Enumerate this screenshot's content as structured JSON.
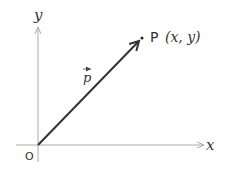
{
  "diagram": {
    "type": "vector-coordinate-plane",
    "axes": {
      "x_label": "x",
      "y_label": "y",
      "origin_label": "O"
    },
    "vector": {
      "label": "p",
      "from": "O",
      "to": "P"
    },
    "point": {
      "name": "P",
      "coords_text": "(x,  y)"
    },
    "colors": {
      "axis": "#aaaaaa",
      "vector": "#333333",
      "text": "#333333"
    }
  }
}
